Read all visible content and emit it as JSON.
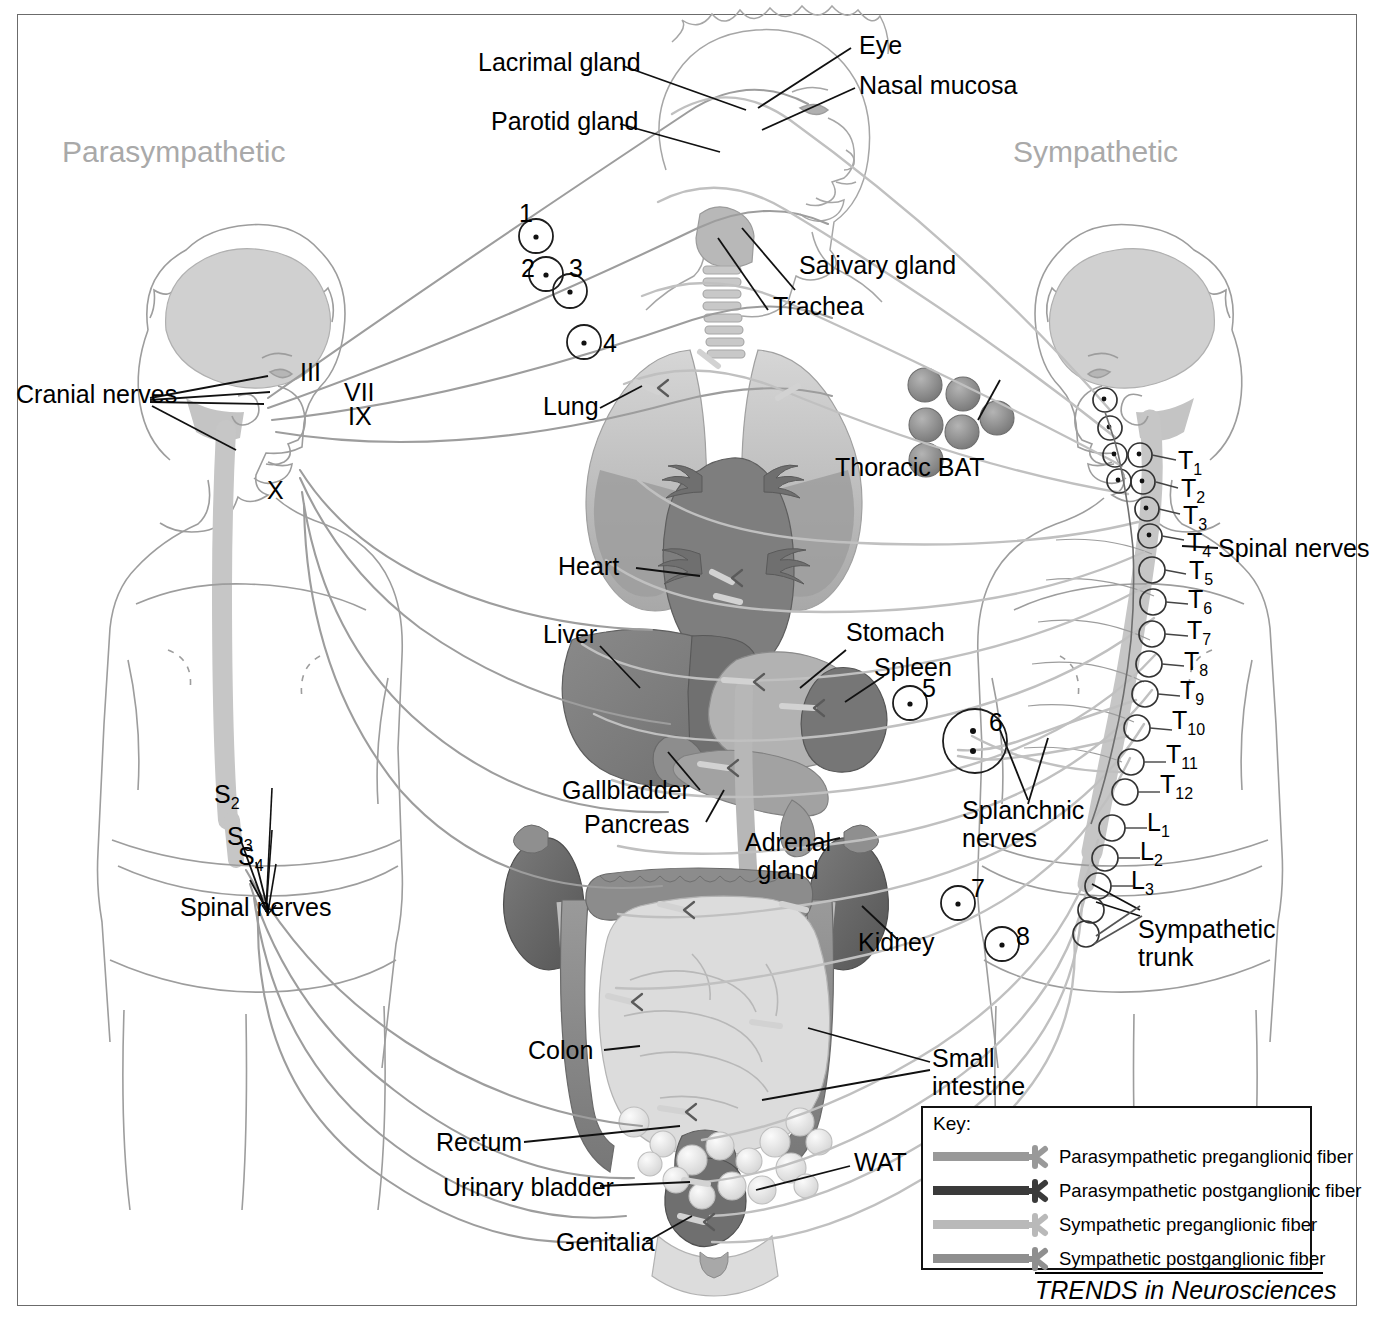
{
  "figure": {
    "title_left": "Parasympathetic",
    "title_right": "Sympathetic",
    "source": "TRENDS in Neurosciences"
  },
  "head_labels": {
    "lacrimal_gland": "Lacrimal gland",
    "parotid_gland": "Parotid gland",
    "eye": "Eye",
    "nasal_mucosa": "Nasal mucosa",
    "salivary_gland": "Salivary gland",
    "trachea": "Trachea"
  },
  "organ_labels": {
    "lung": "Lung",
    "thoracic_bat": "Thoracic BAT",
    "heart": "Heart",
    "liver": "Liver",
    "stomach": "Stomach",
    "spleen": "Spleen",
    "gallbladder": "Gallbladder",
    "pancreas": "Pancreas",
    "adrenal_gland": "Adrenal\ngland",
    "kidney": "Kidney",
    "colon": "Colon",
    "small_intestine": "Small\nintestine",
    "rectum": "Rectum",
    "urinary_bladder": "Urinary bladder",
    "genitalia": "Genitalia",
    "wat": "WAT",
    "splanchnic_nerves": "Splanchnic\nnerves"
  },
  "parasympathetic": {
    "cranial_nerves_label": "Cranial nerves",
    "cranial_nerve_numerals": [
      "III",
      "VII",
      "IX",
      "X"
    ],
    "sacral_roots": [
      "S",
      "S",
      "S"
    ],
    "sacral_root_subs": [
      "2",
      "3",
      "4"
    ],
    "spinal_nerves_label": "Spinal nerves"
  },
  "sympathetic": {
    "spinal_nerves_label": "Spinal nerves",
    "sympathetic_trunk_label": "Sympathetic\ntrunk",
    "segment_letters": [
      "T",
      "T",
      "T",
      "T",
      "T",
      "T",
      "T",
      "T",
      "T",
      "T",
      "T",
      "T",
      "L",
      "L",
      "L"
    ],
    "segment_subs": [
      "1",
      "2",
      "3",
      "4",
      "5",
      "6",
      "7",
      "8",
      "9",
      "10",
      "11",
      "12",
      "1",
      "2",
      "3"
    ]
  },
  "ganglion_numbers": [
    "1",
    "2",
    "3",
    "4",
    "5",
    "6",
    "7",
    "8"
  ],
  "key": {
    "title": "Key:",
    "items": [
      {
        "label": "Parasympathetic preganglionic fiber",
        "color": "#999999"
      },
      {
        "label": "Parasympathetic postganglionic fiber",
        "color": "#3a3a3a"
      },
      {
        "label": "Sympathetic preganglionic fiber",
        "color": "#b9b9b9"
      },
      {
        "label": "Sympathetic postganglionic fiber",
        "color": "#8f8f8f"
      }
    ]
  },
  "colors": {
    "frame": "#6b6b6b",
    "body_outline": "#9a9a9a",
    "brain": "#cfcfcf",
    "spinal_cord": "#c4c4c4",
    "lung": "#c9c9c9",
    "heart": "#8c8c8c",
    "liver": "#8f8f8f",
    "stomach": "#b0b0b0",
    "spleen": "#7e7e7e",
    "kidney": "#6e6e6e",
    "colon": "#8a8a8a",
    "small_intestine": "#d8d8d8",
    "bat": "#8d8d8d",
    "wat": "#ededed",
    "leader_line": "#111111"
  }
}
